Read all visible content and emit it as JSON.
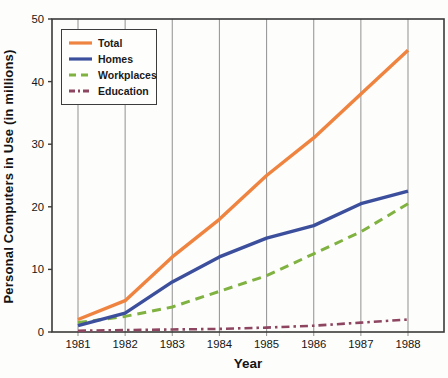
{
  "chart_data": {
    "type": "line",
    "title": "",
    "xlabel": "Year",
    "ylabel": "Personal Computers in Use (in millions)",
    "x": [
      1981,
      1982,
      1983,
      1984,
      1985,
      1986,
      1987,
      1988
    ],
    "ylim": [
      0,
      50
    ],
    "yticks": [
      0,
      10,
      20,
      30,
      40,
      50
    ],
    "grid": "vertical-only",
    "legend_position": "top-left-inside",
    "series": [
      {
        "name": "Education",
        "color": "#8d4560",
        "style": "dashdot",
        "width": 2.6,
        "values": [
          0.2,
          0.3,
          0.4,
          0.5,
          0.7,
          1.0,
          1.5,
          2.0
        ]
      },
      {
        "name": "Workplaces",
        "color": "#80b241",
        "style": "dashed",
        "width": 3,
        "values": [
          1.5,
          2.5,
          4.0,
          6.5,
          9.0,
          12.5,
          16.0,
          20.5
        ]
      },
      {
        "name": "Homes",
        "color": "#3c4f9d",
        "style": "solid",
        "width": 3.4,
        "values": [
          1.0,
          3.0,
          8.0,
          12.0,
          15.0,
          17.0,
          20.5,
          22.5
        ]
      },
      {
        "name": "Total",
        "color": "#ef8440",
        "style": "solid",
        "width": 3.4,
        "values": [
          2.0,
          5.0,
          12.0,
          18.0,
          25.0,
          31.0,
          38.0,
          45.0
        ]
      }
    ],
    "legend_order": [
      "Total",
      "Homes",
      "Workplaces",
      "Education"
    ],
    "colors": {
      "gridline": "#9a9a9a",
      "axis": "#3a3a3a",
      "text": "#161616"
    }
  }
}
